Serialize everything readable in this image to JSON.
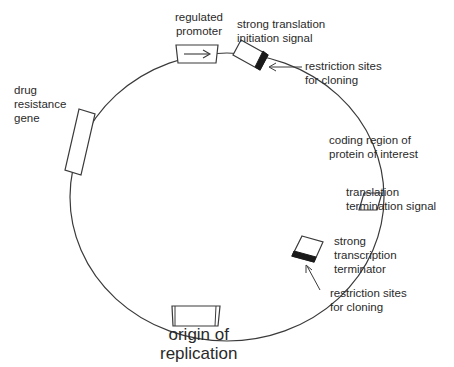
{
  "diagram": {
    "colors": {
      "line": "#3a3a3a",
      "text": "#2a2a2a",
      "marker": "#1a1a1a",
      "background": "#ffffff"
    },
    "plasmid": {
      "cx": 227,
      "cy": 197,
      "rx": 158,
      "ry": 144
    },
    "labels": {
      "regulated_promoter": [
        "regulated",
        "promoter"
      ],
      "translation_initiation": [
        "strong translation",
        "initiation signal"
      ],
      "restriction_sites_top": [
        "restriction sites",
        "for cloning"
      ],
      "coding_region": [
        "coding region of",
        "protein of interest"
      ],
      "translation_termination": [
        "translation",
        "termination signal"
      ],
      "transcription_terminator": [
        "strong",
        "transcription",
        "terminator"
      ],
      "restriction_sites_bottom": [
        "restriction sites",
        "for cloning"
      ],
      "drug_resistance": [
        "drug",
        "resistance",
        "gene"
      ],
      "origin_of_replication": [
        "origin of",
        "replication"
      ]
    },
    "elements": [
      {
        "id": "regulated-promoter",
        "type": "box-with-arrow"
      },
      {
        "id": "translation-initiation-signal",
        "type": "box"
      },
      {
        "id": "restriction-sites-top",
        "type": "black-band"
      },
      {
        "id": "translation-termination-signal",
        "type": "box"
      },
      {
        "id": "transcription-terminator",
        "type": "box"
      },
      {
        "id": "restriction-sites-bottom",
        "type": "black-band"
      },
      {
        "id": "drug-resistance-gene",
        "type": "box"
      },
      {
        "id": "origin-of-replication",
        "type": "box"
      }
    ]
  }
}
